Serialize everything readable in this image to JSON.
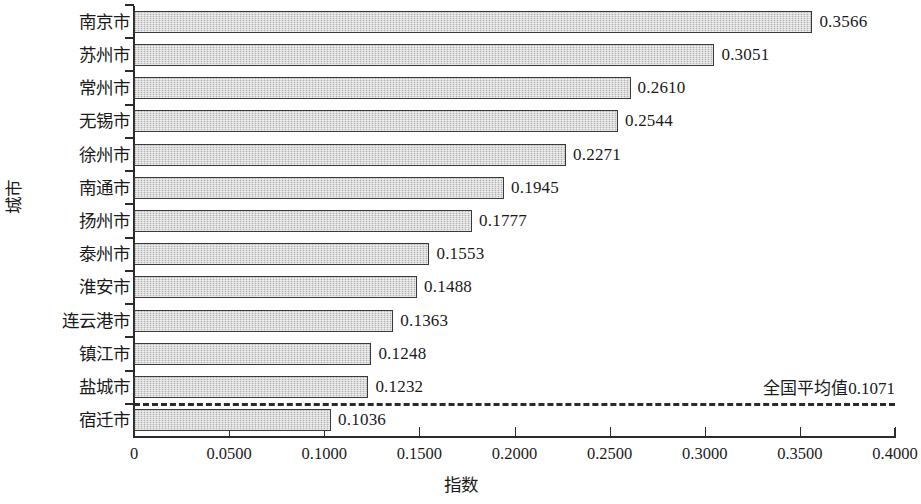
{
  "chart_data": {
    "type": "bar",
    "orientation": "horizontal",
    "title": "",
    "xlabel": "指数",
    "ylabel": "城市",
    "xlim": [
      0,
      0.4
    ],
    "grid": false,
    "legend": null,
    "categories": [
      "南京市",
      "苏州市",
      "常州市",
      "无锡市",
      "徐州市",
      "南通市",
      "扬州市",
      "泰州市",
      "淮安市",
      "连云港市",
      "镇江市",
      "盐城市",
      "宿迁市"
    ],
    "values": [
      0.3566,
      0.3051,
      0.261,
      0.2544,
      0.2271,
      0.1945,
      0.1777,
      0.1553,
      0.1488,
      0.1363,
      0.1248,
      0.1232,
      0.1036
    ],
    "value_labels": [
      "0.3566",
      "0.3051",
      "0.2610",
      "0.2544",
      "0.2271",
      "0.1945",
      "0.1777",
      "0.1553",
      "0.1488",
      "0.1363",
      "0.1248",
      "0.1232",
      "0.1036"
    ],
    "x_ticks": [
      0,
      0.05,
      0.1,
      0.15,
      0.2,
      0.25,
      0.3,
      0.35,
      0.4
    ],
    "x_tick_labels": [
      "0",
      "0.0500",
      "0.1000",
      "0.1500",
      "0.2000",
      "0.2500",
      "0.3000",
      "0.3500",
      "0.4000"
    ],
    "annotations": [
      {
        "name": "national-average",
        "text": "全国平均值0.1071",
        "value": 0.1071,
        "style": "dashed-horizontal-line",
        "position": "between 盐城市 and 宿迁市"
      }
    ],
    "colors": {
      "bar_fill": "#cbcbcb",
      "bar_border": "#3a3a3a",
      "axis": "#2b2b2b",
      "text": "#1a1a1a",
      "background": "#ffffff"
    }
  }
}
